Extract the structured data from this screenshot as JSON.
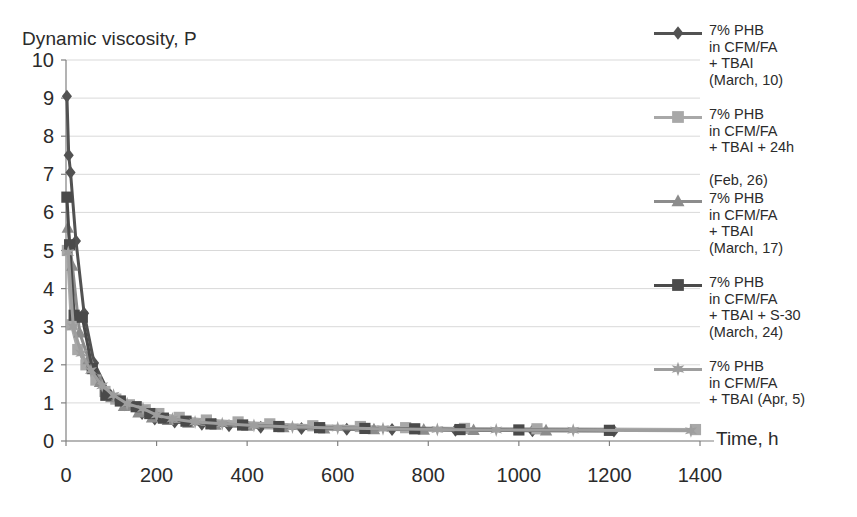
{
  "chart_data": {
    "type": "scatter",
    "title": "",
    "ylabel": "Dynamic viscosity, P",
    "xlabel": "Time, h",
    "xlim": [
      0,
      1400
    ],
    "ylim": [
      0,
      10
    ],
    "xticks": [
      "0",
      "200",
      "400",
      "600",
      "800",
      "1000",
      "1200",
      "1400"
    ],
    "yticks": [
      "0",
      "1",
      "2",
      "3",
      "4",
      "5",
      "6",
      "7",
      "8",
      "9",
      "10"
    ],
    "grid": "horizontal",
    "legend_position": "right",
    "series": [
      {
        "name": "7% PHB\n in CFM/FA\n+ TBAI\n(March, 10)",
        "marker": "diamond",
        "color": "#525252",
        "x": [
          2,
          6,
          10,
          22,
          40,
          62,
          95,
          130,
          168,
          196,
          240,
          300,
          360,
          430,
          520,
          620,
          720,
          860,
          1030,
          1210
        ],
        "y": [
          9.05,
          7.5,
          7.05,
          5.25,
          3.35,
          2.05,
          1.25,
          0.95,
          0.72,
          0.58,
          0.5,
          0.44,
          0.4,
          0.36,
          0.33,
          0.31,
          0.3,
          0.28,
          0.27,
          0.26
        ]
      },
      {
        "name": "7% PHB\n in CFM/FA\n+ TBAI + 24h\n\n(Feb, 26)",
        "marker": "square",
        "color": "#a8a8a8",
        "x": [
          3,
          12,
          26,
          44,
          66,
          86,
          110,
          140,
          175,
          205,
          250,
          310,
          380,
          450,
          545,
          650,
          750,
          880,
          1040,
          1390
        ],
        "y": [
          5.0,
          3.05,
          2.4,
          2.0,
          1.6,
          1.3,
          1.1,
          0.95,
          0.82,
          0.72,
          0.62,
          0.55,
          0.5,
          0.45,
          0.4,
          0.38,
          0.35,
          0.33,
          0.32,
          0.3
        ]
      },
      {
        "name": "7% PHB\n in CFM/FA\n+ TBAI\n(March, 17)",
        "marker": "triangle",
        "color": "#8c8c8c",
        "x": [
          4,
          14,
          30,
          50,
          75,
          100,
          128,
          160,
          190,
          225,
          270,
          330,
          400,
          480,
          570,
          680,
          790,
          900,
          1060
        ],
        "y": [
          5.6,
          4.6,
          2.85,
          2.15,
          1.55,
          1.15,
          0.92,
          0.75,
          0.62,
          0.55,
          0.48,
          0.43,
          0.4,
          0.36,
          0.33,
          0.31,
          0.3,
          0.29,
          0.28
        ]
      },
      {
        "name": "7% PHB\n in CFM/FA\n+ TBAI + S-30\n(March, 24)",
        "marker": "square-dark",
        "color": "#4a4a4a",
        "x": [
          2,
          8,
          18,
          36,
          58,
          88,
          120,
          155,
          185,
          215,
          265,
          320,
          390,
          470,
          560,
          660,
          770,
          870,
          1000,
          1200
        ],
        "y": [
          6.4,
          5.15,
          3.3,
          3.25,
          1.9,
          1.2,
          1.05,
          0.9,
          0.72,
          0.6,
          0.52,
          0.45,
          0.42,
          0.38,
          0.35,
          0.33,
          0.32,
          0.3,
          0.29,
          0.28
        ]
      },
      {
        "name": "7% PHB\n in CFM/FA\n+ TBAI (Apr, 5)",
        "marker": "star",
        "color": "#9e9e9e",
        "x": [
          5,
          16,
          34,
          55,
          80,
          105,
          135,
          170,
          200,
          235,
          285,
          345,
          415,
          500,
          600,
          700,
          820,
          950,
          1120,
          1380
        ],
        "y": [
          4.95,
          3.0,
          2.3,
          1.85,
          1.45,
          1.2,
          0.98,
          0.85,
          0.68,
          0.58,
          0.5,
          0.45,
          0.41,
          0.37,
          0.34,
          0.32,
          0.3,
          0.29,
          0.28,
          0.27
        ]
      }
    ]
  },
  "legend": {
    "entries": [
      {
        "label": "7% PHB\n in CFM/FA\n+ TBAI\n(March, 10)"
      },
      {
        "label": "7% PHB\n in CFM/FA\n+ TBAI + 24h\n\n(Feb, 26)"
      },
      {
        "label": "7% PHB\n in CFM/FA\n+ TBAI\n(March, 17)"
      },
      {
        "label": "7% PHB\n in CFM/FA\n+ TBAI + S-30\n(March, 24)"
      },
      {
        "label": "7% PHB\n in CFM/FA\n+ TBAI (Apr, 5)"
      }
    ]
  },
  "colors": {
    "gridline": "#d9d9d9",
    "axis": "#808080",
    "text": "#2b2b2b",
    "series1": "#525252",
    "series2": "#a8a8a8",
    "series3": "#8c8c8c",
    "series4": "#4a4a4a",
    "series5": "#9e9e9e"
  }
}
